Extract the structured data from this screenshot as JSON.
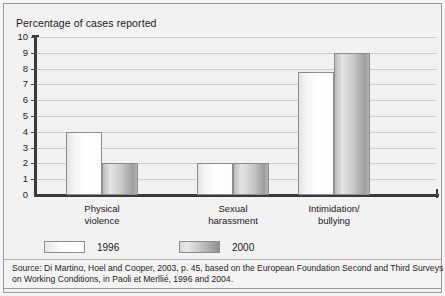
{
  "figure": {
    "title": "Percentage of cases reported",
    "source_lines": [
      "Source: Di Martino, Hoel and Cooper, 2003, p. 45, based on the European Foundation Second and Third Surveys",
      "on Working Conditions, in Paoli et Merllié, 1996 and 2004."
    ]
  },
  "legend": {
    "items": [
      {
        "label": "1996",
        "swatch": "white-gradient",
        "color": "#ffffff"
      },
      {
        "label": "2000",
        "swatch": "gray-gradient",
        "color": "#b4b4b4"
      }
    ]
  },
  "axis": {
    "y_ticks": [
      "10",
      "9",
      "8",
      "7",
      "6",
      "5",
      "4",
      "3",
      "2",
      "1",
      "0"
    ],
    "x_categories": [
      {
        "line1": "Physical",
        "line2": "violence"
      },
      {
        "line1": "Sexual",
        "line2": "harassment"
      },
      {
        "line1": "Intimidation/",
        "line2": "bullying"
      }
    ]
  },
  "chart_data": {
    "type": "bar",
    "title": "Percentage of cases reported",
    "xlabel": "",
    "ylabel": "Percentage of cases reported",
    "ylim": [
      0,
      10
    ],
    "ytick_step": 1,
    "grid": true,
    "legend_position": "bottom",
    "categories": [
      "Physical violence",
      "Sexual harassment",
      "Intimidation/bullying"
    ],
    "series": [
      {
        "name": "1996",
        "values": [
          4,
          2,
          7.8
        ]
      },
      {
        "name": "2000",
        "values": [
          2,
          2,
          9
        ]
      }
    ],
    "source": "Di Martino, Hoel and Cooper, 2003, p. 45, based on the European Foundation Second and Third Surveys on Working Conditions, in Paoli et Merllié, 1996 and 2004."
  }
}
